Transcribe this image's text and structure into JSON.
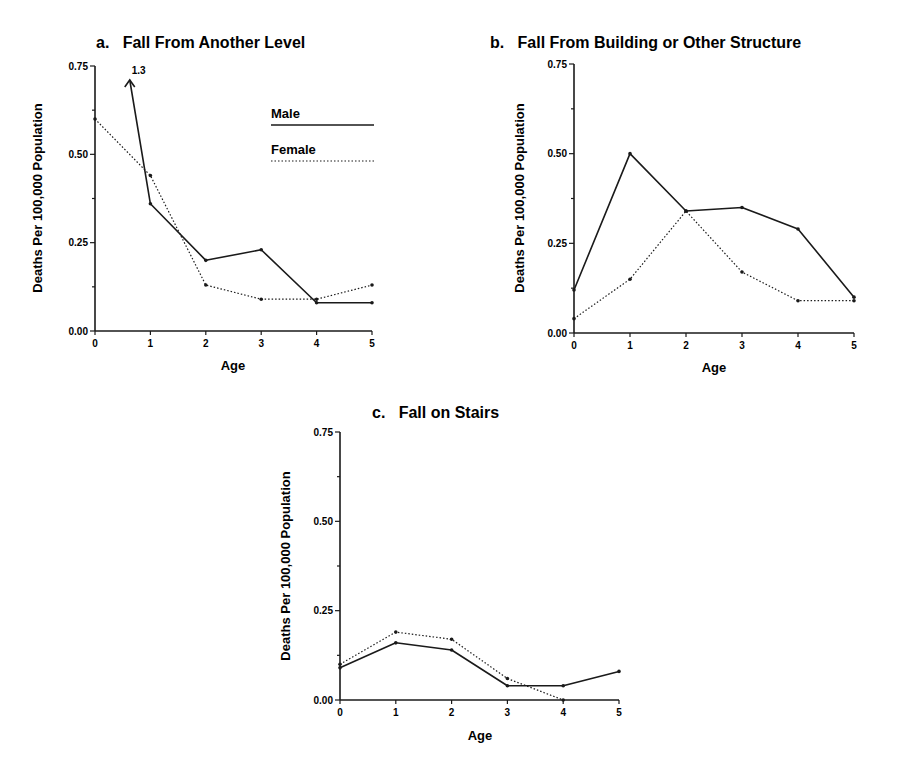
{
  "chart_data": [
    {
      "id": "a",
      "type": "line",
      "title": "a.   Fall From Another Level",
      "xlabel": "Age",
      "ylabel": "Deaths Per 100,000 Population",
      "x": [
        0,
        1,
        2,
        3,
        4,
        5
      ],
      "x_ticks": [
        "0",
        "1",
        "2",
        "3",
        "4",
        "5"
      ],
      "y_ticks": [
        "0.00",
        "0.25",
        "0.50",
        "0.75"
      ],
      "ylim": [
        0,
        0.75
      ],
      "grid": false,
      "legend_position": "upper right",
      "annotations": [
        {
          "text": "1.3",
          "note": "Male value at age 0 off-scale (arrow)"
        }
      ],
      "series": [
        {
          "name": "Male",
          "style": "solid",
          "values": [
            1.3,
            0.36,
            0.2,
            0.23,
            0.08,
            0.08
          ]
        },
        {
          "name": "Female",
          "style": "dotted",
          "values": [
            0.6,
            0.44,
            0.13,
            0.09,
            0.09,
            0.13
          ]
        }
      ]
    },
    {
      "id": "b",
      "type": "line",
      "title": "b.   Fall From Building or Other Structure",
      "xlabel": "Age",
      "ylabel": "Deaths Per 100,000 Population",
      "x": [
        0,
        1,
        2,
        3,
        4,
        5
      ],
      "x_ticks": [
        "0",
        "1",
        "2",
        "3",
        "4",
        "5"
      ],
      "y_ticks": [
        "0.00",
        "0.25",
        "0.50",
        "0.75"
      ],
      "ylim": [
        0,
        0.75
      ],
      "grid": false,
      "series": [
        {
          "name": "Male",
          "style": "solid",
          "values": [
            0.12,
            0.5,
            0.34,
            0.35,
            0.29,
            0.1
          ]
        },
        {
          "name": "Female",
          "style": "dotted",
          "values": [
            0.04,
            0.15,
            0.34,
            0.17,
            0.09,
            0.09
          ]
        }
      ]
    },
    {
      "id": "c",
      "type": "line",
      "title": "c.   Fall on Stairs",
      "xlabel": "Age",
      "ylabel": "Deaths Per 100,000 Population",
      "x": [
        0,
        1,
        2,
        3,
        4,
        5
      ],
      "x_ticks": [
        "0",
        "1",
        "2",
        "3",
        "4",
        "5"
      ],
      "y_ticks": [
        "0.00",
        "0.25",
        "0.50",
        "0.75"
      ],
      "ylim": [
        0,
        0.75
      ],
      "grid": false,
      "series": [
        {
          "name": "Male",
          "style": "solid",
          "values": [
            0.09,
            0.16,
            0.14,
            0.04,
            0.04,
            0.08
          ]
        },
        {
          "name": "Female",
          "style": "dotted",
          "values": [
            0.1,
            0.19,
            0.17,
            0.06,
            0.0,
            null
          ]
        }
      ]
    }
  ],
  "legend": {
    "male_label": "Male",
    "female_label": "Female"
  },
  "colors": {
    "ink": "#1a1a1a",
    "background": "#ffffff"
  }
}
